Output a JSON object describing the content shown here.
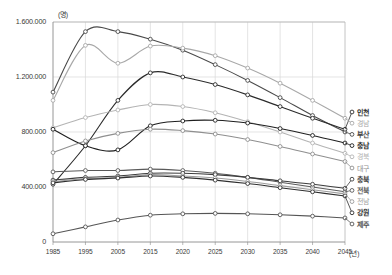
{
  "axes": {
    "y_unit": "(명)",
    "y_ticks": [
      "1.600.000",
      "1.200.000",
      "800.000",
      "400.000",
      "0"
    ],
    "y_tick_values": [
      1600000,
      1200000,
      800000,
      400000,
      0
    ],
    "x_unit": "(년)",
    "x_ticks": [
      "1985",
      "1995",
      "2005",
      "2015",
      "2020",
      "2025",
      "2030",
      "2035",
      "2040",
      "2045"
    ]
  },
  "legend": [
    {
      "label": "인천",
      "color": "#2b2b2b"
    },
    {
      "label": "경남",
      "color": "#a8a8a8"
    },
    {
      "label": "부산",
      "color": "#4a4a4a"
    },
    {
      "label": "충남",
      "color": "#1f1f1f"
    },
    {
      "label": "경북",
      "color": "#b4b4b4"
    },
    {
      "label": "대구",
      "color": "#8f8f8f"
    },
    {
      "label": "충북",
      "color": "#3d3d3d"
    },
    {
      "label": "전북",
      "color": "#5a5a5a"
    },
    {
      "label": "전남",
      "color": "#9c9c9c"
    },
    {
      "label": "강원",
      "color": "#2f2f2f"
    },
    {
      "label": "제주",
      "color": "#555555"
    }
  ],
  "chart_data": {
    "type": "line",
    "title": "",
    "xlabel": "(년)",
    "ylabel": "(명)",
    "x": [
      1985,
      1995,
      2005,
      2015,
      2020,
      2025,
      2030,
      2035,
      2040,
      2045
    ],
    "xlim": [
      1985,
      2045
    ],
    "ylim": [
      0,
      1600000
    ],
    "grid": true,
    "legend_position": "right",
    "markers": "open-circle",
    "series": [
      {
        "name": "부산",
        "color": "#4a4a4a",
        "values": [
          1090000,
          1530000,
          1530000,
          1475000,
          1395000,
          1290000,
          1175000,
          1050000,
          920000,
          800000
        ]
      },
      {
        "name": "경남",
        "color": "#a8a8a8",
        "values": [
          1030000,
          1430000,
          1300000,
          1425000,
          1410000,
          1355000,
          1265000,
          1155000,
          1030000,
          900000
        ]
      },
      {
        "name": "인천",
        "color": "#2b2b2b",
        "values": [
          420000,
          700000,
          1030000,
          1230000,
          1200000,
          1145000,
          1070000,
          985000,
          900000,
          820000
        ]
      },
      {
        "name": "경북",
        "color": "#b4b4b4",
        "values": [
          830000,
          905000,
          960000,
          1000000,
          985000,
          940000,
          875000,
          800000,
          720000,
          645000
        ]
      },
      {
        "name": "충남",
        "color": "#1f1f1f",
        "values": [
          820000,
          700000,
          670000,
          845000,
          880000,
          885000,
          865000,
          825000,
          775000,
          720000
        ]
      },
      {
        "name": "대구",
        "color": "#8f8f8f",
        "values": [
          650000,
          735000,
          790000,
          820000,
          810000,
          785000,
          745000,
          695000,
          640000,
          585000
        ]
      },
      {
        "name": "전북",
        "color": "#5a5a5a",
        "values": [
          510000,
          520000,
          520000,
          530000,
          520000,
          500000,
          470000,
          435000,
          400000,
          365000
        ]
      },
      {
        "name": "충북",
        "color": "#3d3d3d",
        "values": [
          450000,
          470000,
          480000,
          500000,
          500000,
          490000,
          470000,
          445000,
          420000,
          390000
        ]
      },
      {
        "name": "전남",
        "color": "#9c9c9c",
        "values": [
          440000,
          460000,
          470000,
          490000,
          480000,
          465000,
          440000,
          410000,
          380000,
          350000
        ]
      },
      {
        "name": "강원",
        "color": "#2f2f2f",
        "values": [
          430000,
          455000,
          465000,
          480000,
          470000,
          450000,
          425000,
          395000,
          365000,
          335000
        ]
      },
      {
        "name": "제주",
        "color": "#555555",
        "values": [
          60000,
          110000,
          160000,
          195000,
          205000,
          208000,
          205000,
          198000,
          188000,
          175000
        ]
      }
    ]
  }
}
